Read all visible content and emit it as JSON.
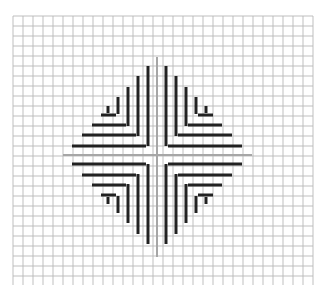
{
  "canvas": {
    "width": 329,
    "height": 293,
    "background": "#ffffff"
  },
  "grid": {
    "x0": 13,
    "x1": 313,
    "y0": 16,
    "y1": 285,
    "spacing": 10,
    "color": "#b8b8b8",
    "width": 0.9
  },
  "axes": {
    "color": "#a6a6a6",
    "width": 2,
    "center": {
      "x": 157,
      "y": 155
    },
    "horizontal": {
      "x1": 63,
      "x2": 252
    },
    "vertical": {
      "y1": 57,
      "y2": 257
    }
  },
  "pattern": {
    "color": "#222222",
    "stroke_width": 3,
    "description": "Four mirrored nested L-shaped bracket sets forming a diamond around the center cross",
    "top_left": {
      "verticals": [
        {
          "x": 148,
          "y1": 66,
          "y2": 146
        },
        {
          "x": 138,
          "y1": 76,
          "y2": 136
        },
        {
          "x": 128,
          "y1": 87,
          "y2": 126
        },
        {
          "x": 118,
          "y1": 97,
          "y2": 114
        },
        {
          "x": 108,
          "y1": 106,
          "y2": 113
        }
      ],
      "horizontals": [
        {
          "y": 146,
          "x1": 72,
          "x2": 146
        },
        {
          "y": 135,
          "x1": 82,
          "x2": 136
        },
        {
          "y": 125,
          "x1": 92,
          "x2": 126
        },
        {
          "y": 115,
          "x1": 101,
          "x2": 116
        }
      ]
    }
  }
}
